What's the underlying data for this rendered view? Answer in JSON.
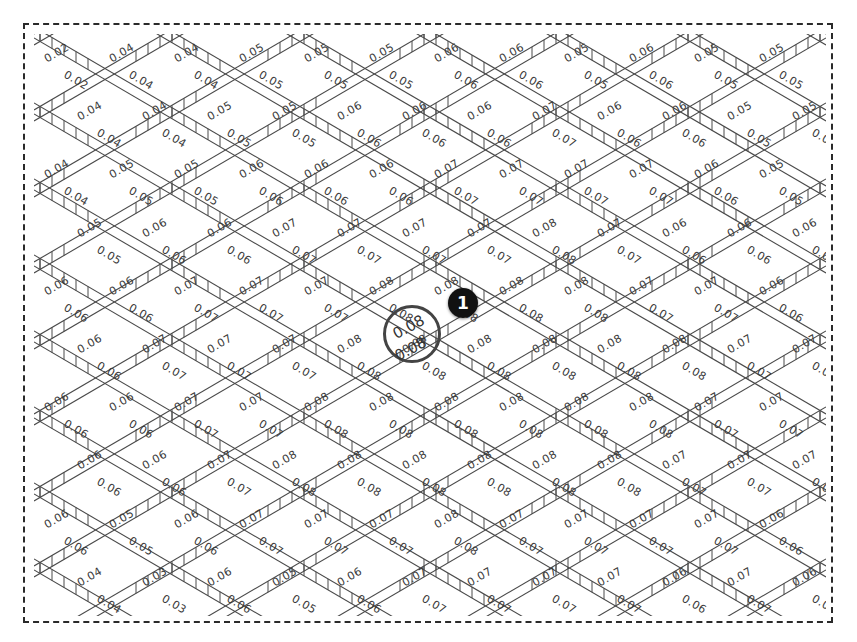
{
  "diagram": {
    "title": "",
    "frame_style": "dashed",
    "lattice": {
      "dx": 65,
      "dy": 38,
      "strip_width": 11,
      "hatch_spacing": 12,
      "line_color": "#4a4a4a"
    },
    "label_values": [
      [
        "0.02",
        "0.04",
        "0.04",
        "0.05",
        "0.05",
        "0.05",
        "0.06",
        "0.06",
        "0.05",
        "0.06",
        "0.05",
        "0.05"
      ],
      [
        "0.04",
        "0.04",
        "0.05",
        "0.05",
        "0.06",
        "0.06",
        "0.06",
        "0.07",
        "0.06",
        "0.06",
        "0.05",
        "0.05"
      ],
      [
        "0.04",
        "0.05",
        "0.05",
        "0.06",
        "0.06",
        "0.06",
        "0.07",
        "0.07",
        "0.07",
        "0.07",
        "0.06",
        "0.05"
      ],
      [
        "0.05",
        "0.06",
        "0.06",
        "0.07",
        "0.07",
        "0.07",
        "0.07",
        "0.08",
        "0.07",
        "0.06",
        "0.06",
        "0.06"
      ],
      [
        "0.06",
        "0.06",
        "0.07",
        "0.07",
        "0.07",
        "0.08",
        "0.08",
        "0.08",
        "0.08",
        "0.07",
        "0.07",
        "0.06"
      ],
      [
        "0.06",
        "0.07",
        "0.07",
        "0.07",
        "0.08",
        "0.08",
        "0.08",
        "0.08",
        "0.08",
        "0.08",
        "0.07",
        "0.07"
      ],
      [
        "0.06",
        "0.06",
        "0.07",
        "0.07",
        "0.08",
        "0.08",
        "0.08",
        "0.08",
        "0.08",
        "0.08",
        "0.07",
        "0.07"
      ],
      [
        "0.06",
        "0.06",
        "0.07",
        "0.08",
        "0.08",
        "0.08",
        "0.08",
        "0.08",
        "0.08",
        "0.07",
        "0.07",
        "0.07"
      ],
      [
        "0.06",
        "0.05",
        "0.06",
        "0.07",
        "0.07",
        "0.07",
        "0.08",
        "0.07",
        "0.07",
        "0.07",
        "0.07",
        "0.06"
      ],
      [
        "0.04",
        "0.03",
        "0.06",
        "0.05",
        "0.06",
        "0.07",
        "0.07",
        "0.07",
        "0.07",
        "0.06",
        "0.07",
        "0.06"
      ]
    ],
    "callout": {
      "circle_label_top": "0.08",
      "circle_label_bottom": "0.08",
      "badge_number": "1",
      "badge_color": "#111111"
    }
  }
}
